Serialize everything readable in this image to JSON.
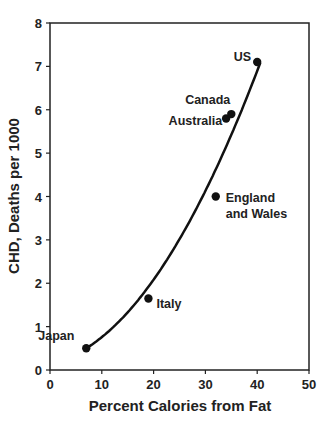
{
  "chart_data": {
    "type": "scatter",
    "title": "",
    "xlabel": "Percent Calories from Fat",
    "ylabel": "CHD, Deaths per 1000",
    "xlim": [
      0,
      50
    ],
    "ylim": [
      0,
      8
    ],
    "xticks": [
      0,
      10,
      20,
      30,
      40,
      50
    ],
    "yticks": [
      0,
      1,
      2,
      3,
      4,
      5,
      6,
      7,
      8
    ],
    "grid": false,
    "points": [
      {
        "label": "Japan",
        "x": 7,
        "y": 0.5
      },
      {
        "label": "Italy",
        "x": 19,
        "y": 1.65
      },
      {
        "label": "England and Wales",
        "x": 32,
        "y": 4.0
      },
      {
        "label": "Australia",
        "x": 34,
        "y": 5.8
      },
      {
        "label": "Canada",
        "x": 35,
        "y": 5.9
      },
      {
        "label": "US",
        "x": 40,
        "y": 7.1
      }
    ],
    "fit_curve": "smooth increasing curve from Japan to US"
  }
}
